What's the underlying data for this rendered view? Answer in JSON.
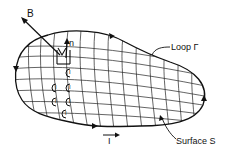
{
  "diagram": {
    "labels": {
      "B": "B",
      "n": "n",
      "loop": "Loop Γ",
      "surface": "Surface S",
      "current": "I"
    },
    "current_loops": [
      {
        "label": "I"
      },
      {
        "label": "I"
      },
      {
        "label": "I"
      },
      {
        "label": "I"
      },
      {
        "label": "I"
      },
      {
        "label": "I"
      }
    ],
    "colors": {
      "ink": "#111111",
      "background": "#ffffff"
    }
  }
}
